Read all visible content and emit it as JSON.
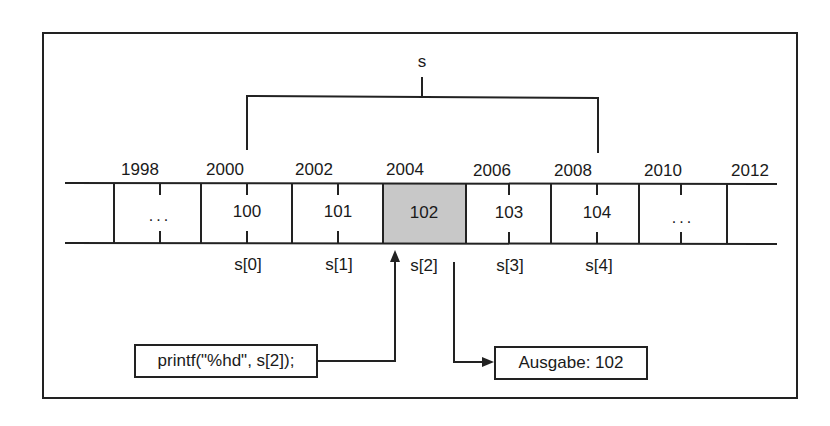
{
  "diagram": {
    "array_name": "s",
    "addresses": [
      "1998",
      "2000",
      "2002",
      "2004",
      "2006",
      "2008",
      "2010",
      "2012"
    ],
    "cells": [
      {
        "value": "...",
        "highlighted": false
      },
      {
        "value": "100",
        "highlighted": false
      },
      {
        "value": "101",
        "highlighted": false
      },
      {
        "value": "102",
        "highlighted": true
      },
      {
        "value": "103",
        "highlighted": false
      },
      {
        "value": "104",
        "highlighted": false
      },
      {
        "value": "...",
        "highlighted": false
      }
    ],
    "indices": [
      "s[0]",
      "s[1]",
      "s[2]",
      "s[3]",
      "s[4]"
    ],
    "code_box": "printf(\"%hd\", s[2]);",
    "output_box": "Ausgabe: 102",
    "colors": {
      "line": "#222222",
      "highlight_fill": "#c8c8c8",
      "background": "#ffffff"
    }
  }
}
